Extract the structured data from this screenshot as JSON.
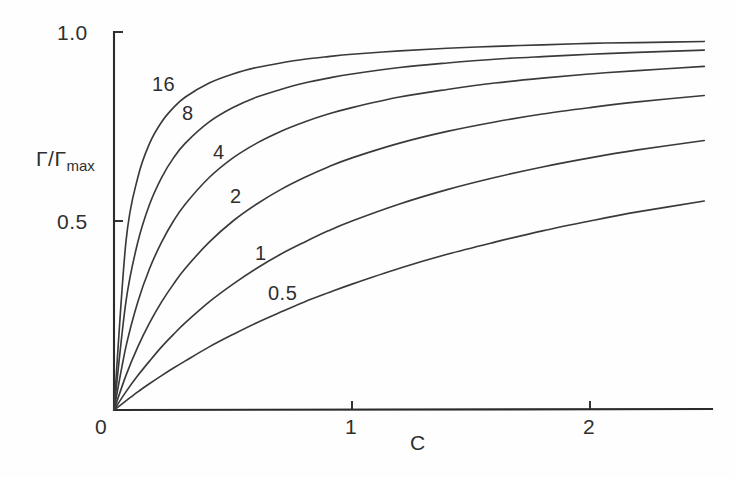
{
  "figure": {
    "background_color": "#fefefe",
    "ink_color": "#2f2f2f"
  },
  "axes": {
    "y_label_main": "Γ/Γ",
    "y_label_sub": "max",
    "x_label": "C",
    "y_ticks": [
      {
        "value": 1.0,
        "label": "1.0"
      },
      {
        "value": 0.5,
        "label": "0.5"
      },
      {
        "value": 0.0,
        "label": "0"
      }
    ],
    "x_ticks": [
      {
        "value": 0,
        "label": "0"
      },
      {
        "value": 1,
        "label": "1"
      },
      {
        "value": 2,
        "label": "2"
      }
    ]
  },
  "curve_labels": [
    {
      "text": "16",
      "x": 152,
      "y": 74
    },
    {
      "text": "8",
      "x": 182,
      "y": 103
    },
    {
      "text": "4",
      "x": 213,
      "y": 142
    },
    {
      "text": "2",
      "x": 230,
      "y": 186
    },
    {
      "text": "1",
      "x": 255,
      "y": 243
    },
    {
      "text": "0.5",
      "x": 268,
      "y": 283
    }
  ],
  "chart_data": {
    "type": "line",
    "title": "",
    "subtitle": "",
    "xlabel": "C",
    "ylabel": "Γ/Γmax",
    "xlim": [
      0,
      2.48
    ],
    "ylim": [
      0,
      1.0
    ],
    "grid": false,
    "legend": "inline curve labels",
    "equation": "Γ/Γmax = K·C / (1 + K·C)",
    "x_tick_labels": [
      "0",
      "1",
      "2"
    ],
    "y_tick_labels": [
      "0",
      "0.5",
      "1.0"
    ],
    "x": [
      0,
      0.05,
      0.1,
      0.15,
      0.2,
      0.25,
      0.3,
      0.4,
      0.5,
      0.6,
      0.7,
      0.8,
      0.9,
      1.0,
      1.2,
      1.4,
      1.6,
      1.8,
      2.0,
      2.2,
      2.48
    ],
    "series": [
      {
        "name": "16",
        "K": 16,
        "values": [
          0,
          0.444,
          0.615,
          0.706,
          0.762,
          0.8,
          0.828,
          0.865,
          0.889,
          0.906,
          0.918,
          0.928,
          0.935,
          0.941,
          0.95,
          0.957,
          0.962,
          0.966,
          0.97,
          0.972,
          0.975
        ]
      },
      {
        "name": "8",
        "K": 8,
        "values": [
          0,
          0.286,
          0.444,
          0.545,
          0.615,
          0.667,
          0.706,
          0.762,
          0.8,
          0.828,
          0.848,
          0.865,
          0.878,
          0.889,
          0.906,
          0.918,
          0.928,
          0.935,
          0.941,
          0.946,
          0.952
        ]
      },
      {
        "name": "4",
        "K": 4,
        "values": [
          0,
          0.167,
          0.286,
          0.375,
          0.444,
          0.5,
          0.545,
          0.615,
          0.667,
          0.706,
          0.737,
          0.762,
          0.783,
          0.8,
          0.828,
          0.848,
          0.865,
          0.878,
          0.889,
          0.898,
          0.909
        ]
      },
      {
        "name": "2",
        "K": 2,
        "values": [
          0,
          0.091,
          0.167,
          0.231,
          0.286,
          0.333,
          0.375,
          0.444,
          0.5,
          0.545,
          0.583,
          0.615,
          0.643,
          0.667,
          0.706,
          0.737,
          0.762,
          0.783,
          0.8,
          0.815,
          0.832
        ]
      },
      {
        "name": "1",
        "K": 1,
        "values": [
          0,
          0.048,
          0.091,
          0.13,
          0.167,
          0.2,
          0.231,
          0.286,
          0.333,
          0.375,
          0.412,
          0.444,
          0.474,
          0.5,
          0.545,
          0.583,
          0.615,
          0.643,
          0.667,
          0.688,
          0.713
        ]
      },
      {
        "name": "0.5",
        "K": 0.5,
        "values": [
          0,
          0.024,
          0.048,
          0.07,
          0.091,
          0.111,
          0.13,
          0.167,
          0.2,
          0.231,
          0.259,
          0.286,
          0.31,
          0.333,
          0.375,
          0.412,
          0.444,
          0.474,
          0.5,
          0.524,
          0.553
        ]
      }
    ]
  }
}
